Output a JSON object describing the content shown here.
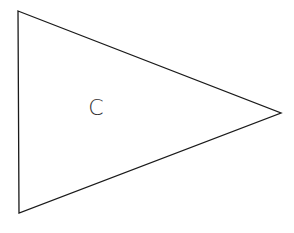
{
  "diagram": {
    "shape": "triangle",
    "vertices": [
      [
        18,
        11
      ],
      [
        281,
        113
      ],
      [
        19,
        213
      ]
    ],
    "stroke_color": "#1a1a1a",
    "fill_color": "#ffffff",
    "label": {
      "text": "C",
      "x": 96,
      "y": 115,
      "color": "#333333"
    }
  }
}
